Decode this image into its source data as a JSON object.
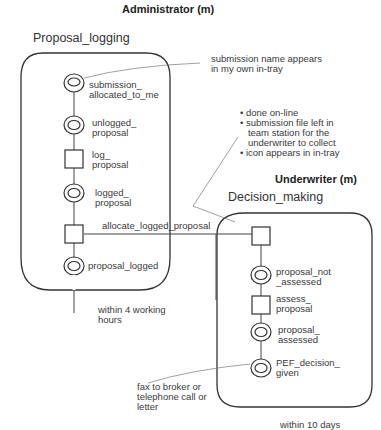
{
  "roles": {
    "administrator": {
      "label": "Administrator (m)",
      "process": "Proposal_logging",
      "duration": "within 4 working\nhours"
    },
    "underwriter": {
      "label": "Underwriter (m)",
      "process": "Decision_making",
      "duration": "within 10 days"
    }
  },
  "nodes": {
    "submission_allocated": "submission_\nallocated_to_me",
    "unlogged": "unlogged_\nproposal",
    "log_proposal": "log_\nproposal",
    "logged": "logged_\nproposal",
    "proposal_logged": "proposal_logged",
    "allocate": "allocate_logged_proposal",
    "not_assessed": "proposal_not\n_assessed",
    "assess": "assess_\nproposal",
    "assessed": "proposal_\nassessed",
    "pef": "PEF_decision_\ngiven"
  },
  "annotations": {
    "intray": "submission name appears\nin my own in-tray",
    "online": "• done on-line\n• submission file left in\n   team station for the\n   underwriter to collect\n• icon appears in in-tray",
    "fax": "fax to broker or\ntelephone call or\nletter"
  }
}
